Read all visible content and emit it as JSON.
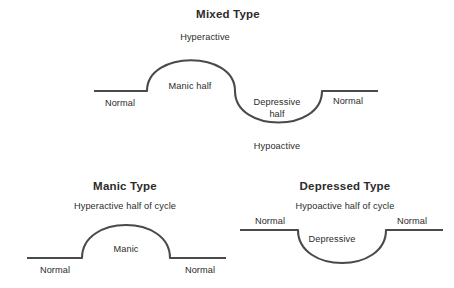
{
  "figure": {
    "background_color": "#ffffff",
    "line_color": "#4a4a4a",
    "text_color": "#2b2b2b"
  },
  "panels": {
    "mixed": {
      "title": "Mixed Type",
      "peak_label": "Hyperactive",
      "manic_label": "Manic half",
      "left_baseline_label": "Normal",
      "right_baseline_label": "Normal",
      "depressive_label_line1": "Depressive",
      "depressive_label_line2": "half",
      "trough_label": "Hypoactive"
    },
    "manic": {
      "title": "Manic Type",
      "subtitle": "Hyperactive half of cycle",
      "arch_label": "Manic",
      "left_baseline_label": "Normal",
      "right_baseline_label": "Normal"
    },
    "depressed": {
      "title": "Depressed Type",
      "subtitle": "Hypoactive half of cycle",
      "trough_label": "Depressive",
      "left_baseline_label": "Normal",
      "right_baseline_label": "Normal"
    }
  }
}
